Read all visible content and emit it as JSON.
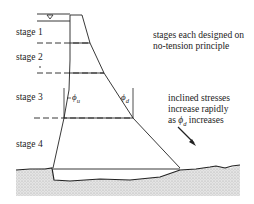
{
  "diagram": {
    "stages": [
      {
        "label": "stage 1"
      },
      {
        "label": "stage 2"
      },
      {
        "label": "stage 3"
      },
      {
        "label": "stage 4"
      }
    ],
    "water_level_symbol": "∇",
    "angles": {
      "upstream": {
        "symbol": "ϕ",
        "subscript": "u"
      },
      "downstream": {
        "symbol": "ϕ",
        "subscript": "d"
      }
    },
    "notes": {
      "design": "stages each designed on no-tension principle",
      "stress": {
        "line1": "inclined stresses",
        "line2": "increase rapidly",
        "line3_prefix": "as ",
        "line3_symbol": "ϕ",
        "line3_subscript": "d",
        "line3_suffix": " increases"
      }
    }
  }
}
